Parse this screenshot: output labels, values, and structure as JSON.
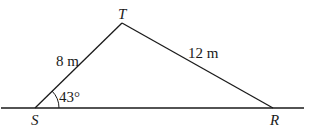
{
  "diagram": {
    "type": "triangle",
    "vertices": {
      "S": {
        "label": "S",
        "x": 35,
        "y": 108
      },
      "T": {
        "label": "T",
        "x": 122,
        "y": 23
      },
      "R": {
        "label": "R",
        "x": 273,
        "y": 108
      }
    },
    "sides": {
      "ST": {
        "label": "8 m"
      },
      "TR": {
        "label": "12 m"
      }
    },
    "angles": {
      "S": {
        "label": "43°"
      }
    },
    "baseline": {
      "x1": 1,
      "x2": 304,
      "y": 108
    },
    "stroke_color": "#1a1a1a"
  }
}
